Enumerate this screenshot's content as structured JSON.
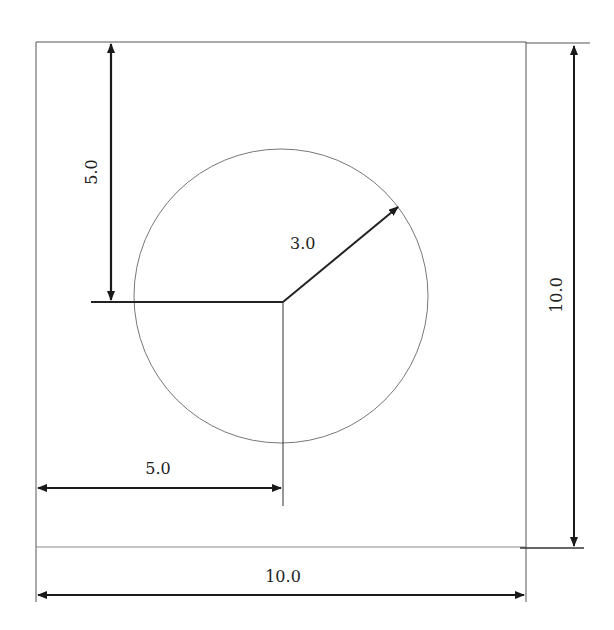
{
  "diagram": {
    "type": "dimensioned drawing",
    "shape": "square plate with circular region",
    "square": {
      "width": "10.0",
      "height": "10.0"
    },
    "circle": {
      "radius": "3.0",
      "center_x": "5.0",
      "center_y": "5.0"
    },
    "labels": {
      "top_left_vertical": "5.0",
      "radius": "3.0",
      "right_vertical": "10.0",
      "bottom_center_offset": "5.0",
      "bottom_width": "10.0"
    },
    "colors": {
      "lines": "#222222",
      "circle": "#777777",
      "background": "#ffffff"
    }
  }
}
